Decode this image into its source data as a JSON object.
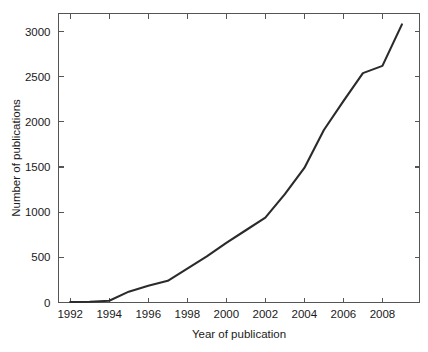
{
  "chart_data": {
    "type": "line",
    "title": "",
    "xlabel": "Year of publication",
    "ylabel": "Number of publications",
    "xlim": [
      1991.4,
      2009.9
    ],
    "ylim": [
      0,
      3200
    ],
    "grid": false,
    "legend": null,
    "line_color": "#2b2b2b",
    "x": [
      1992,
      1993,
      1994,
      1995,
      1996,
      1997,
      1998,
      1999,
      2000,
      2001,
      2002,
      2003,
      2004,
      2005,
      2006,
      2007,
      2008,
      2009
    ],
    "values": [
      5,
      8,
      20,
      120,
      185,
      240,
      375,
      510,
      660,
      800,
      940,
      1200,
      1490,
      1910,
      2230,
      2540,
      2620,
      3080
    ],
    "series": [
      {
        "name": "Number of publications",
        "values": [
          5,
          8,
          20,
          120,
          185,
          240,
          375,
          510,
          660,
          800,
          940,
          1200,
          1490,
          1910,
          2230,
          2540,
          2620,
          3080
        ]
      }
    ],
    "x_ticks": [
      1992,
      1994,
      1996,
      1998,
      2000,
      2002,
      2004,
      2006,
      2008
    ],
    "x_tick_labels": [
      "1992",
      "1994",
      "1996",
      "1998",
      "2000",
      "2002",
      "2004",
      "2006",
      "2008"
    ],
    "y_ticks": [
      0,
      500,
      1000,
      1500,
      2000,
      2500,
      3000
    ],
    "y_tick_labels": [
      "0",
      "500",
      "1000",
      "1500",
      "2000",
      "2500",
      "3000"
    ]
  },
  "axis": {
    "x_title": "Year of publication",
    "y_title": "Number of publications",
    "x_labels": [
      "1992",
      "1994",
      "1996",
      "1998",
      "2000",
      "2002",
      "2004",
      "2006",
      "2008"
    ],
    "y_labels": [
      "0",
      "500",
      "1000",
      "1500",
      "2000",
      "2500",
      "3000"
    ]
  }
}
